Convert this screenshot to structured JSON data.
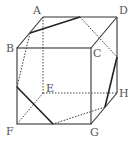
{
  "figure": {
    "vertices": {
      "A": {
        "label": "A",
        "x": 43,
        "y": 17
      },
      "B": {
        "label": "B",
        "x": 17,
        "y": 48
      },
      "C": {
        "label": "C",
        "x": 91,
        "y": 48
      },
      "D": {
        "label": "D",
        "x": 117,
        "y": 17
      },
      "E": {
        "label": "E",
        "x": 43,
        "y": 93
      },
      "F": {
        "label": "F",
        "x": 17,
        "y": 124
      },
      "G": {
        "label": "G",
        "x": 91,
        "y": 124
      },
      "H": {
        "label": "H",
        "x": 117,
        "y": 93
      }
    },
    "solid_edges": [
      "AB",
      "AD",
      "BC",
      "CD",
      "BF",
      "CG",
      "DH",
      "FG",
      "GH"
    ],
    "hidden_edges": [
      "AE",
      "EF",
      "EH"
    ],
    "section": {
      "points": {
        "P1": {
          "on": "AB",
          "x": 30,
          "y": 33
        },
        "P2": {
          "on": "AD",
          "x": 80,
          "y": 17
        },
        "P3": {
          "on": "DH",
          "x": 117,
          "y": 57
        },
        "P4": {
          "on": "GH",
          "x": 105,
          "y": 107
        },
        "P5": {
          "on": "FG",
          "x": 53,
          "y": 124
        },
        "P6": {
          "on": "BF",
          "x": 17,
          "y": 87
        }
      },
      "solid": [
        "P1-P2",
        "P3-P4",
        "P5-P6"
      ],
      "dashed": [
        "P2-P3",
        "P4-P5",
        "P6-P1"
      ]
    },
    "colors": {
      "edge": "#333333",
      "section": "#222222",
      "label": "#555555"
    }
  }
}
